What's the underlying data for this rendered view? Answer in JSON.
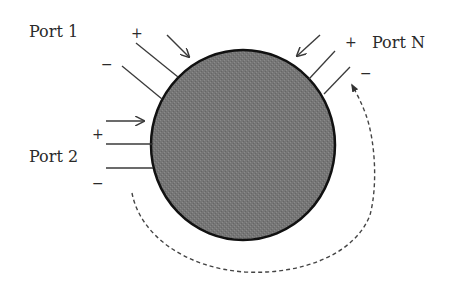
{
  "diagram": {
    "body": {
      "shape": "circle",
      "center": [
        243,
        145
      ],
      "rx": 92,
      "ry": 95,
      "fill": "#767676",
      "stroke": "#111111"
    },
    "ports": [
      {
        "label": "Port 1",
        "label_pos": [
          38,
          37
        ],
        "plus_sign": "+",
        "minus_sign": "−",
        "plus_pos": [
          131,
          38
        ],
        "minus_pos": [
          101,
          68
        ]
      },
      {
        "label": "Port 2",
        "label_pos": [
          27,
          162
        ],
        "plus_sign": "+",
        "minus_sign": "−",
        "plus_pos": [
          92,
          139
        ],
        "minus_pos": [
          92,
          187
        ]
      },
      {
        "label": "Port N",
        "label_pos": [
          373,
          47
        ],
        "plus_sign": "+",
        "minus_sign": "−",
        "plus_pos": [
          345,
          47
        ],
        "minus_pos": [
          360,
          78
        ]
      }
    ],
    "current_arrows": [
      {
        "port": "Port 1",
        "direction": "into network"
      },
      {
        "port": "Port 2",
        "direction": "into network"
      },
      {
        "port": "Port N",
        "direction": "into network"
      }
    ],
    "dashed_path": {
      "description": "continuation from Port 2 around bottom to Port N",
      "style": "dashed with arrowhead"
    }
  }
}
